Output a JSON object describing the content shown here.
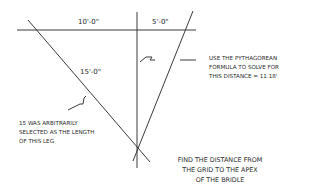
{
  "diagram": {
    "dimensions": {
      "left_segment": "10'-0\"",
      "right_segment": "5'-0\"",
      "leg": "15'-0\""
    },
    "notes": {
      "pythagorean": [
        "USE THE PYTHAGOREAN",
        "FORMULA TO SOLVE FOR",
        "THIS DISTANCE = 11.18'"
      ],
      "arbitrary": [
        "15 WAS ARBITRARILY",
        "SELECTED AS THE LENGTH",
        "OF THIS LEG"
      ],
      "title": [
        "FIND THE DISTANCE FROM",
        "THE GRID TO THE APEX",
        "OF THE BRIDLE"
      ]
    },
    "line_color": "#3a3a3a"
  }
}
